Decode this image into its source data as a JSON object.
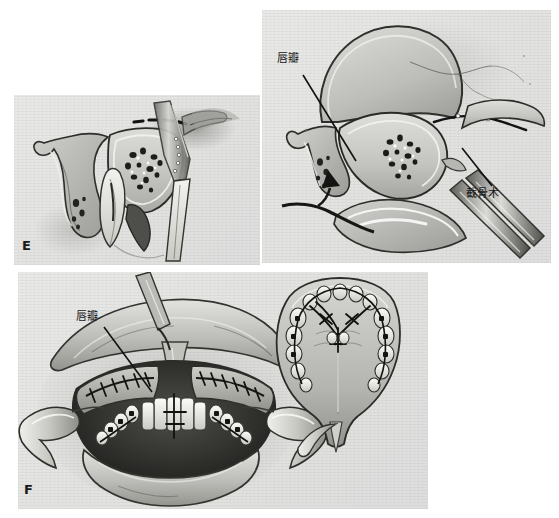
{
  "figure": {
    "type": "medical-surgical-illustration",
    "background_color": "#ffffff",
    "plate_paper_color": "#e4e4e2",
    "ink_color": "#1a1a1a",
    "panels": [
      {
        "id": "panel-e",
        "letter": "E",
        "view": "sagittal cross-section of anterior maxilla with osteotome and dashed osteotomy line",
        "x": 14,
        "y": 95,
        "width": 246,
        "height": 170
      },
      {
        "id": "panel-top-right",
        "letter": "",
        "view": "sagittal cross-section showing lip flap elevated and down-fracture osteotomy with instruments",
        "x": 262,
        "y": 10,
        "width": 289,
        "height": 253
      },
      {
        "id": "panel-f",
        "letter": "F",
        "view": "intraoral frontal view with cheek retractors and sutured incisions, plus occlusal inset of palate",
        "x": 18,
        "y": 272,
        "width": 410,
        "height": 237
      }
    ],
    "labels": [
      {
        "id": "label-lipflap-top",
        "text": "唇瓣",
        "meaning": "lip flap",
        "x": 277,
        "y": 53,
        "leader_from": [
          303,
          75
        ],
        "leader_to": [
          356,
          161
        ]
      },
      {
        "id": "label-osteotomy",
        "text": "截骨术",
        "meaning": "osteotomy",
        "x": 466,
        "y": 188,
        "leader_from": [
          492,
          186
        ],
        "leader_to": [
          462,
          148
        ]
      },
      {
        "id": "label-lipflap-bottom",
        "text": "唇瓣",
        "meaning": "lip flap",
        "x": 76,
        "y": 311,
        "leader_from": [
          104,
          327
        ],
        "leader_to": [
          152,
          392
        ]
      }
    ],
    "letters": [
      {
        "id": "letter-e",
        "text": "E",
        "x": 22,
        "y": 238
      },
      {
        "id": "letter-f",
        "text": "F",
        "x": 24,
        "y": 482
      }
    ]
  }
}
